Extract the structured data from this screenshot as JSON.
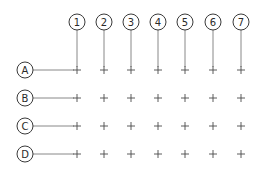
{
  "diagram": {
    "type": "structural-grid",
    "columns": [
      {
        "label": "1",
        "x": 77
      },
      {
        "label": "2",
        "x": 104
      },
      {
        "label": "3",
        "x": 131
      },
      {
        "label": "4",
        "x": 158
      },
      {
        "label": "5",
        "x": 185
      },
      {
        "label": "6",
        "x": 213
      },
      {
        "label": "7",
        "x": 241
      }
    ],
    "rows": [
      {
        "label": "A",
        "y": 70
      },
      {
        "label": "B",
        "y": 98
      },
      {
        "label": "C",
        "y": 126
      },
      {
        "label": "D",
        "y": 154
      }
    ],
    "column_bubble_y": 22,
    "row_bubble_x": 25,
    "bubble_radius": 8,
    "colors": {
      "stroke": "#3a3a3a",
      "line": "#6a6a6a",
      "background": "#ffffff"
    }
  }
}
